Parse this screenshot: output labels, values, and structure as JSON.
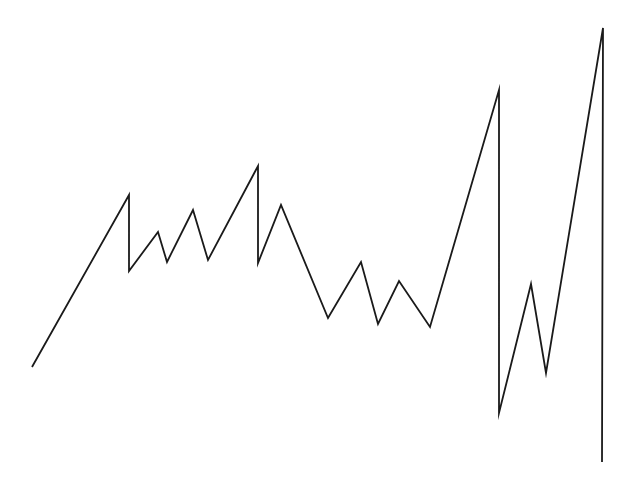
{
  "chart_data": {
    "type": "line",
    "title": "",
    "xlabel": "",
    "ylabel": "",
    "axes_visible": false,
    "grid": false,
    "legend": "none",
    "xlim": [
      0,
      638
    ],
    "ylim": [
      0,
      483
    ],
    "series": [
      {
        "name": "series-1",
        "color": "#1a1a1a",
        "x": [
          32,
          129,
          129,
          158,
          167,
          193,
          208,
          258,
          258,
          281,
          328,
          361,
          378,
          399,
          430,
          499,
          499,
          531,
          546,
          603,
          602
        ],
        "y": [
          116,
          288,
          212,
          251,
          221,
          273,
          223,
          317,
          220,
          278,
          165,
          221,
          159,
          202,
          156,
          393,
          70,
          199,
          110,
          455,
          21
        ]
      }
    ]
  }
}
